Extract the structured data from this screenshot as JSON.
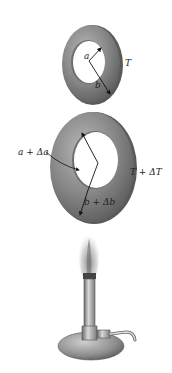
{
  "figure": {
    "ring_initial": {
      "inner_radius_label": "a",
      "outer_radius_label": "b",
      "temperature_label": "T"
    },
    "ring_heated": {
      "inner_radius_label": "a + Δa",
      "outer_radius_label": "b + Δb",
      "temperature_label": "T + ΔT"
    },
    "heat_source": "bunsen-burner",
    "colors": {
      "ring_fill": "#7a7a7a",
      "ring_highlight": "#b5b5b5",
      "ring_shadow": "#4e4e4e",
      "metal": "#9a9a9a",
      "flame": "#8a8a8a",
      "background": "#ffffff"
    }
  }
}
